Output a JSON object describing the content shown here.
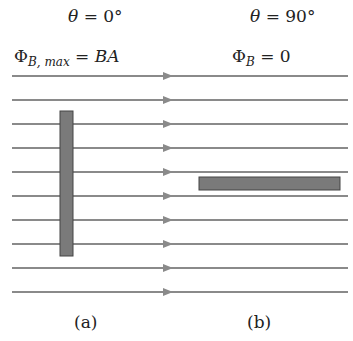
{
  "labels": {
    "theta_a": {
      "sym": "θ",
      "rest": " = 0°"
    },
    "theta_b": {
      "sym": "θ",
      "rest": " = 90°"
    },
    "flux_a": {
      "phi": "Φ",
      "sub": "B, max",
      "eq": " = ",
      "val": "BA"
    },
    "flux_b": {
      "phi": "Φ",
      "sub": "B",
      "eq": " = 0"
    },
    "panel_a": "(a)",
    "panel_b": "(b)"
  },
  "field_lines": {
    "count": 10,
    "y_start": 76,
    "spacing": 24,
    "x1": 12,
    "x2": 348,
    "arrow_x": 163,
    "color": "#8a8a8a"
  },
  "plates": [
    {
      "name": "plate-perpendicular",
      "x": 60,
      "y": 111,
      "w": 13,
      "h": 145,
      "color": "#7a7a7a"
    },
    {
      "name": "plate-parallel",
      "x": 199,
      "y": 177,
      "w": 141,
      "h": 13,
      "color": "#7a7a7a"
    }
  ]
}
